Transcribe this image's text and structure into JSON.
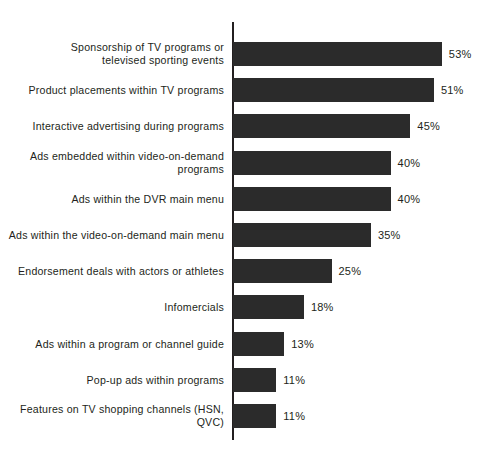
{
  "chart_data": {
    "type": "bar",
    "orientation": "horizontal",
    "title": "",
    "subtitle": "",
    "xlabel": "",
    "ylabel": "",
    "xlim": [
      0,
      53
    ],
    "grid": false,
    "legend": null,
    "value_suffix": "%",
    "categories": [
      "Sponsorship of TV programs or\ntelevised sporting events",
      "Product placements within TV programs",
      "Interactive advertising during programs",
      "Ads embedded within video-on-demand\nprograms",
      "Ads within the DVR main menu",
      "Ads within the video-on-demand main menu",
      "Endorsement deals with actors or athletes",
      "Infomercials",
      "Ads within a program or channel guide",
      "Pop-up ads within programs",
      "Features on TV shopping channels (HSN, QVC)"
    ],
    "values": [
      53,
      51,
      45,
      40,
      40,
      35,
      25,
      18,
      13,
      11,
      11
    ],
    "value_labels": [
      "53%",
      "51%",
      "45%",
      "40%",
      "40%",
      "35%",
      "25%",
      "18%",
      "13%",
      "11%",
      "11%"
    ],
    "colors": {
      "bar": "#2b2b2b",
      "axis": "#231f20",
      "text": "#231f20",
      "background": "#ffffff"
    }
  }
}
